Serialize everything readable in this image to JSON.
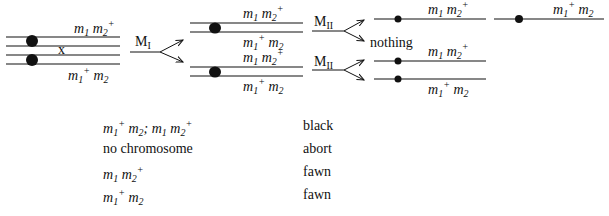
{
  "diagram": {
    "parent": {
      "top_label": {
        "m1": "m",
        "s1": "1",
        "m2": "m",
        "s2": "2",
        "sup2": "+"
      },
      "bottom_label": {
        "m1": "m",
        "s1": "1",
        "sup1": "+",
        "m2": "m",
        "s2": "2"
      },
      "crossover_mark": "x"
    },
    "meiosis_I": {
      "label": "M",
      "sub": "I"
    },
    "meiosis_II": {
      "label": "M",
      "sub": "II"
    },
    "products": {
      "nothing": "nothing"
    },
    "labels": {
      "m1m2p": "m1 m2+",
      "m1pm2": "m1+ m2"
    }
  },
  "table": {
    "rows": [
      {
        "genotype_a": {
          "m": "m",
          "s1": "1",
          "sup1": "+",
          "m2": "m",
          "s2": "2"
        },
        "sep": "; ",
        "genotype_b": {
          "m": "m",
          "s1": "1",
          "m2": "m",
          "s2": "2",
          "sup2": "+"
        },
        "phenotype": "black"
      },
      {
        "genotype_text": "no chromosome",
        "phenotype": "abort"
      },
      {
        "genotype_a": {
          "m": "m",
          "s1": "1",
          "m2": "m",
          "s2": "2",
          "sup2": "+"
        },
        "phenotype": "fawn"
      },
      {
        "genotype_a": {
          "m": "m",
          "s1": "1",
          "sup1": "+",
          "m2": "m",
          "s2": "2"
        },
        "phenotype": "fawn"
      }
    ]
  }
}
